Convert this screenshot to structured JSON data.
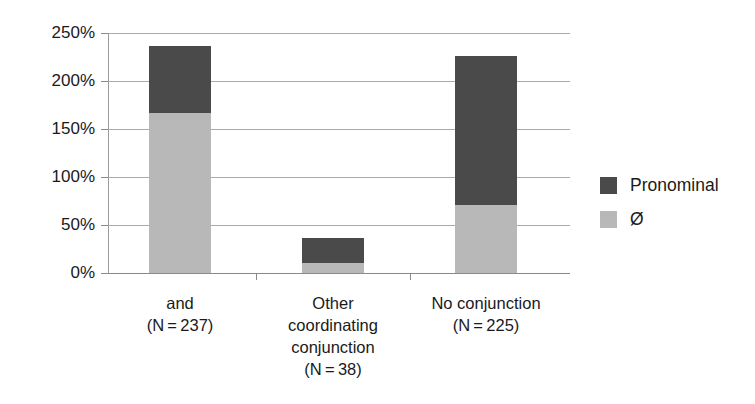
{
  "chart_data": {
    "type": "bar",
    "subtype": "stacked-bar",
    "title": "",
    "xlabel": "",
    "ylabel": "",
    "ylim": [
      0,
      250
    ],
    "y_unit": "%",
    "grid": true,
    "legend_position": "right",
    "categories": [
      "and\n(N=237)",
      "Other coordinating conjunction\n(N=38)",
      "No conjunction\n(N=225)"
    ],
    "category_lines": [
      [
        "and",
        "(N = 237)"
      ],
      [
        "Other",
        "coordinating",
        "conjunction",
        "(N = 38)"
      ],
      [
        "No conjunction",
        "(N = 225)"
      ]
    ],
    "series": [
      {
        "name": "Pronominal",
        "color": "#4a4a4a",
        "values": [
          70,
          27,
          155
        ]
      },
      {
        "name": "Ø",
        "color": "#b8b8b8",
        "values": [
          167,
          10,
          71
        ]
      }
    ],
    "stack_order_bottom_to_top": [
      "Ø",
      "Pronominal"
    ],
    "totals": [
      237,
      37,
      226
    ],
    "yticks": [
      0,
      50,
      100,
      150,
      200,
      250
    ],
    "ytick_labels": [
      "0%",
      "50%",
      "100%",
      "150%",
      "200%",
      "250%"
    ]
  },
  "legend": {
    "items": [
      {
        "label": "Pronominal",
        "color": "#4a4a4a"
      },
      {
        "label": "Ø",
        "color": "#b8b8b8"
      }
    ]
  },
  "colors": {
    "pronominal": "#4a4a4a",
    "zero": "#b8b8b8",
    "gridline": "#a9a9a9",
    "axis": "#8a8a8a",
    "background": "#ffffff",
    "text": "#1a1a1a"
  }
}
